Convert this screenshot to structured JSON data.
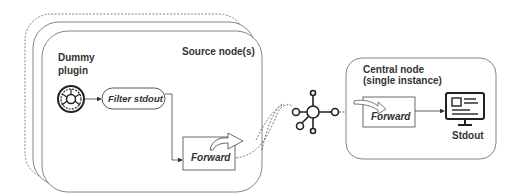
{
  "diagram": {
    "source_group": {
      "label": "Source node(s)",
      "plugin_label_line1": "Dummy",
      "plugin_label_line2": "plugin",
      "filter_label": "Filter stdout",
      "forward_label": "Forward"
    },
    "hub": {
      "icon": "network-hub-icon"
    },
    "central_node": {
      "label_line1": "Central node",
      "label_line2": "(single instance)",
      "forward_label": "Forward",
      "output_label": "Stdout"
    },
    "colors": {
      "stroke": "#444444",
      "text": "#333333",
      "background": "#ffffff"
    }
  }
}
